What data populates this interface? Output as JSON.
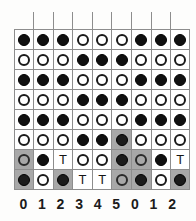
{
  "diagram": {
    "column_labels": [
      "0",
      "1",
      "2",
      "3",
      "4",
      "5",
      "0",
      "1",
      "2"
    ],
    "colors": {
      "black_stone": "#111111",
      "white_stone_outline": "#1a1a1a",
      "shaded_cell": "#a8a8a8",
      "grid_line": "#8d8d8d",
      "background": "#fdfdfc"
    },
    "legend": {
      "black": "filled-circle",
      "white": "open-circle",
      "t": "T"
    },
    "rows": [
      {
        "index": 0,
        "kind": "spacer",
        "cells": [
          {
            "mark": "",
            "shaded": false
          },
          {
            "mark": "",
            "shaded": false
          },
          {
            "mark": "",
            "shaded": false
          },
          {
            "mark": "",
            "shaded": false
          },
          {
            "mark": "",
            "shaded": false
          },
          {
            "mark": "",
            "shaded": false
          },
          {
            "mark": "",
            "shaded": false
          },
          {
            "mark": "",
            "shaded": false
          },
          {
            "mark": "",
            "shaded": false
          }
        ]
      },
      {
        "index": 1,
        "kind": "data",
        "cells": [
          {
            "mark": "black",
            "shaded": false
          },
          {
            "mark": "black",
            "shaded": false
          },
          {
            "mark": "black",
            "shaded": false
          },
          {
            "mark": "white",
            "shaded": false
          },
          {
            "mark": "white",
            "shaded": false
          },
          {
            "mark": "white",
            "shaded": false
          },
          {
            "mark": "black",
            "shaded": false
          },
          {
            "mark": "black",
            "shaded": false
          },
          {
            "mark": "black",
            "shaded": false
          }
        ]
      },
      {
        "index": 2,
        "kind": "data",
        "cells": [
          {
            "mark": "white",
            "shaded": false
          },
          {
            "mark": "white",
            "shaded": false
          },
          {
            "mark": "white",
            "shaded": false
          },
          {
            "mark": "black",
            "shaded": false
          },
          {
            "mark": "black",
            "shaded": false
          },
          {
            "mark": "black",
            "shaded": false
          },
          {
            "mark": "white",
            "shaded": false
          },
          {
            "mark": "white",
            "shaded": false
          },
          {
            "mark": "white",
            "shaded": false
          }
        ]
      },
      {
        "index": 3,
        "kind": "data",
        "cells": [
          {
            "mark": "black",
            "shaded": false
          },
          {
            "mark": "black",
            "shaded": false
          },
          {
            "mark": "black",
            "shaded": false
          },
          {
            "mark": "white",
            "shaded": false
          },
          {
            "mark": "white",
            "shaded": false
          },
          {
            "mark": "white",
            "shaded": false
          },
          {
            "mark": "black",
            "shaded": false
          },
          {
            "mark": "black",
            "shaded": false
          },
          {
            "mark": "black",
            "shaded": false
          }
        ]
      },
      {
        "index": 4,
        "kind": "data",
        "cells": [
          {
            "mark": "white",
            "shaded": false
          },
          {
            "mark": "white",
            "shaded": false
          },
          {
            "mark": "white",
            "shaded": false
          },
          {
            "mark": "black",
            "shaded": false
          },
          {
            "mark": "black",
            "shaded": false
          },
          {
            "mark": "black",
            "shaded": false
          },
          {
            "mark": "white",
            "shaded": false
          },
          {
            "mark": "white",
            "shaded": false
          },
          {
            "mark": "white",
            "shaded": false
          }
        ]
      },
      {
        "index": 5,
        "kind": "data",
        "cells": [
          {
            "mark": "black",
            "shaded": false
          },
          {
            "mark": "black",
            "shaded": false
          },
          {
            "mark": "black",
            "shaded": false
          },
          {
            "mark": "white",
            "shaded": false
          },
          {
            "mark": "white",
            "shaded": false
          },
          {
            "mark": "white",
            "shaded": false
          },
          {
            "mark": "black",
            "shaded": false
          },
          {
            "mark": "black",
            "shaded": false
          },
          {
            "mark": "black",
            "shaded": false
          }
        ]
      },
      {
        "index": 6,
        "kind": "data",
        "cells": [
          {
            "mark": "white",
            "shaded": false
          },
          {
            "mark": "white",
            "shaded": false
          },
          {
            "mark": "white",
            "shaded": false
          },
          {
            "mark": "black",
            "shaded": false
          },
          {
            "mark": "black",
            "shaded": false
          },
          {
            "mark": "black",
            "shaded": true
          },
          {
            "mark": "white",
            "shaded": false
          },
          {
            "mark": "white",
            "shaded": false
          },
          {
            "mark": "white",
            "shaded": false
          }
        ]
      },
      {
        "index": 7,
        "kind": "data",
        "cells": [
          {
            "mark": "white",
            "shaded": true
          },
          {
            "mark": "black",
            "shaded": false
          },
          {
            "mark": "t",
            "shaded": false
          },
          {
            "mark": "white",
            "shaded": false
          },
          {
            "mark": "white",
            "shaded": false
          },
          {
            "mark": "black",
            "shaded": true
          },
          {
            "mark": "white",
            "shaded": true
          },
          {
            "mark": "black",
            "shaded": false
          },
          {
            "mark": "t",
            "shaded": false
          }
        ]
      },
      {
        "index": 8,
        "kind": "data",
        "cells": [
          {
            "mark": "black",
            "shaded": true
          },
          {
            "mark": "white",
            "shaded": false
          },
          {
            "mark": "black",
            "shaded": true
          },
          {
            "mark": "t",
            "shaded": false
          },
          {
            "mark": "t",
            "shaded": false
          },
          {
            "mark": "white",
            "shaded": true
          },
          {
            "mark": "black",
            "shaded": true
          },
          {
            "mark": "white",
            "shaded": false
          },
          {
            "mark": "black",
            "shaded": true
          }
        ]
      }
    ]
  }
}
